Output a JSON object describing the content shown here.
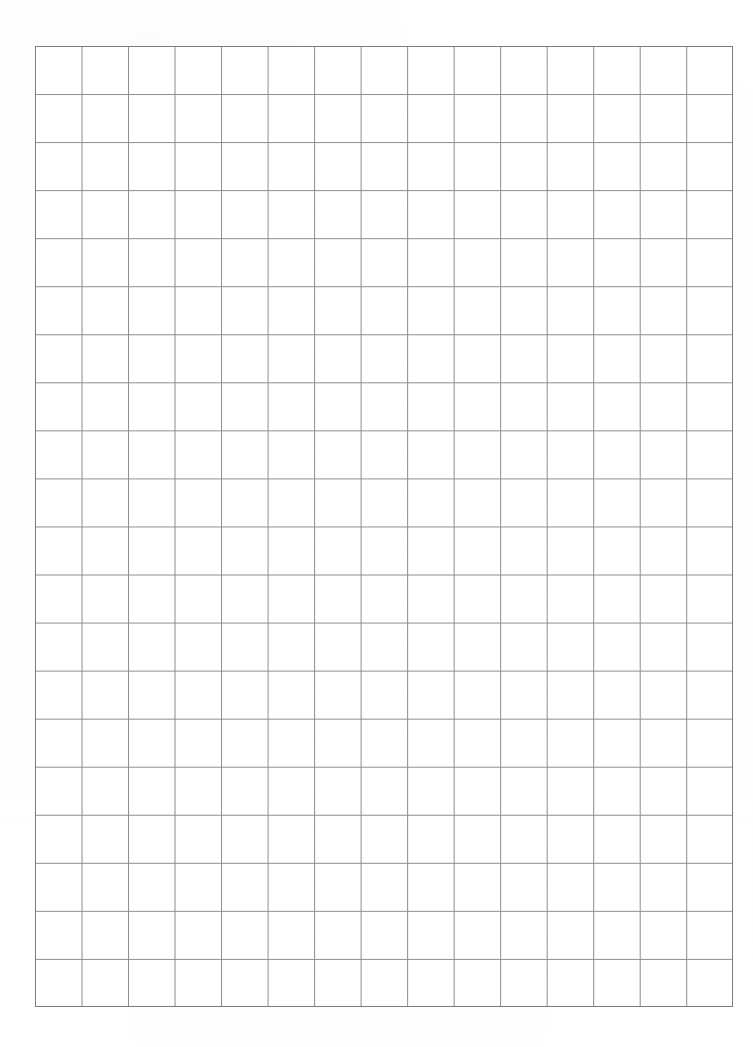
{
  "document": {
    "type": "grid-paper-scan",
    "title": "Blank graph paper sheet",
    "page_width_px": 753,
    "page_height_px": 1047,
    "background_color": "#ffffff",
    "text_content": "",
    "annotations": []
  },
  "grid": {
    "name": "square-grid",
    "columns": 15,
    "rows": 20,
    "origin_x_px": 35,
    "origin_y_px": 46,
    "right_edge_px": 733,
    "bottom_edge_px": 1007,
    "width_px": 698,
    "height_px": 961,
    "cell_width_px": 46.53,
    "cell_height_px": 48.05,
    "line_color": "#8c8c8c",
    "frame_color": "#7e7e7e",
    "line_width_px": 1,
    "cell_fill": "#ffffff"
  },
  "margins": {
    "left_px": 35,
    "top_px": 46,
    "right_px": 20,
    "bottom_px": 40
  }
}
